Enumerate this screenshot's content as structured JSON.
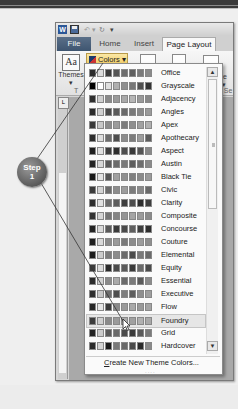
{
  "callout": {
    "line1": "Step",
    "line2": "1"
  },
  "quick_access": {
    "app_icon": "W",
    "save_icon": "save-icon",
    "undo_icon": "undo-icon",
    "redo_icon": "redo-icon",
    "customize_icon": "dropdown-icon"
  },
  "tabs": [
    {
      "label": "File",
      "active": false
    },
    {
      "label": "Home",
      "active": false
    },
    {
      "label": "Insert",
      "active": false
    },
    {
      "label": "Page Layout",
      "active": true
    }
  ],
  "ribbon": {
    "themes_label": "Themes",
    "themes_arrow": "▾",
    "themes_icon_text": "Aa",
    "colors_label": "Colors ▾",
    "size_fragment": "ize",
    "size_arrow": "▾",
    "group_theme_fragment": "T",
    "group_page_setup_fragment": "ge Se"
  },
  "ruler_box": "L",
  "theme_colors": {
    "items": [
      {
        "name": "Office",
        "swatches": [
          "#2b2b2b",
          "#dcdcdc",
          "#3b3b3b",
          "#555555",
          "#6e6e6e",
          "#5f5f5f",
          "#7a7a7a",
          "#8a8a8a"
        ]
      },
      {
        "name": "Grayscale",
        "swatches": [
          "#000000",
          "#ffffff",
          "#e0e0e0",
          "#b0b0b0",
          "#909090",
          "#777777",
          "#505050",
          "#333333"
        ]
      },
      {
        "name": "Adjacency",
        "swatches": [
          "#2f2f2f",
          "#cfcfcf",
          "#8a8a8a",
          "#9a9a9a",
          "#a8a8a8",
          "#b5b5b5",
          "#999999",
          "#888888"
        ]
      },
      {
        "name": "Angles",
        "swatches": [
          "#2a2a2a",
          "#d0d0d0",
          "#4a4a4a",
          "#5a5a5a",
          "#6a6a6a",
          "#7a7a7a",
          "#8a8a8a",
          "#9a9a9a"
        ]
      },
      {
        "name": "Apex",
        "swatches": [
          "#3a3a3a",
          "#c8c8c8",
          "#8c8c8c",
          "#9c9c9c",
          "#7c7c7c",
          "#8f8f8f",
          "#a0a0a0",
          "#b0b0b0"
        ]
      },
      {
        "name": "Apothecary",
        "swatches": [
          "#2c2c2c",
          "#dedede",
          "#6c6c6c",
          "#4c4c4c",
          "#8c8c8c",
          "#7c7c7c",
          "#9c9c9c",
          "#5c5c5c"
        ]
      },
      {
        "name": "Aspect",
        "swatches": [
          "#1e1e1e",
          "#e0e0e0",
          "#3e3e3e",
          "#2e2e2e",
          "#4e4e4e",
          "#3a3a3a",
          "#555555",
          "#888888"
        ]
      },
      {
        "name": "Austin",
        "swatches": [
          "#252525",
          "#d8d8d8",
          "#5a5a5a",
          "#6a6a6a",
          "#7a7a7a",
          "#5e5e5e",
          "#6e6e6e",
          "#8a8a8a"
        ]
      },
      {
        "name": "Black Tie",
        "swatches": [
          "#1a1a1a",
          "#e4e4e4",
          "#555555",
          "#a0a0a0",
          "#909090",
          "#808080",
          "#8a8a8a",
          "#9a9a9a"
        ]
      },
      {
        "name": "Civic",
        "swatches": [
          "#3c3c3c",
          "#d4d4d4",
          "#6c6c6c",
          "#8c8c8c",
          "#9c9c9c",
          "#7c7c7c",
          "#8a8a8a",
          "#6a6a6a"
        ]
      },
      {
        "name": "Clarity",
        "swatches": [
          "#2d2d2d",
          "#e2e2e2",
          "#6d6d6d",
          "#5d5d5d",
          "#3d3d3d",
          "#4d4d4d",
          "#2d2d2d",
          "#3d3d3d"
        ]
      },
      {
        "name": "Composite",
        "swatches": [
          "#333333",
          "#d6d6d6",
          "#757575",
          "#858585",
          "#959595",
          "#a5a5a5",
          "#9a9a9a",
          "#8a8a8a"
        ]
      },
      {
        "name": "Concourse",
        "swatches": [
          "#242424",
          "#dadada",
          "#5a5a5a",
          "#3a3a3a",
          "#4a4a4a",
          "#5e5e5e",
          "#3e3e3e",
          "#2e2e2e"
        ]
      },
      {
        "name": "Couture",
        "swatches": [
          "#1f1f1f",
          "#d9d9d9",
          "#8a8a8a",
          "#9a9a9a",
          "#7a7a7a",
          "#8c8c8c",
          "#9c9c9c",
          "#8e8e8e"
        ]
      },
      {
        "name": "Elemental",
        "swatches": [
          "#1c1c1c",
          "#cccccc",
          "#7c7c7c",
          "#8c8c8c",
          "#6c6c6c",
          "#4c4c4c",
          "#7a7a7a",
          "#6a6a6a"
        ]
      },
      {
        "name": "Equity",
        "swatches": [
          "#3a3a3a",
          "#dcdcdc",
          "#2a2a2a",
          "#4a4a4a",
          "#5a5a5a",
          "#3a3a3a",
          "#6a6a6a",
          "#4a4a4a"
        ]
      },
      {
        "name": "Essential",
        "swatches": [
          "#2a2a2a",
          "#d2d2d2",
          "#8a8a8a",
          "#aaaaaa",
          "#6a6a6a",
          "#7a7a7a",
          "#5a5a5a",
          "#8a8a8a"
        ]
      },
      {
        "name": "Executive",
        "swatches": [
          "#2e2e2e",
          "#c8c8c8",
          "#6e6e6e",
          "#4e4e4e",
          "#7e7e7e",
          "#5e5e5e",
          "#8e8e8e",
          "#9e9e9e"
        ]
      },
      {
        "name": "Flow",
        "swatches": [
          "#262626",
          "#e6e6e6",
          "#3a3a3a",
          "#8a8a8a",
          "#9a9a9a",
          "#aaaaaa",
          "#9a9a9a",
          "#a5a5a5"
        ]
      },
      {
        "name": "Foundry",
        "swatches": [
          "#3c3c3c",
          "#cfcfcf",
          "#8a8a8a",
          "#9a9a9a",
          "#aaaaaa",
          "#a0a0a0",
          "#b0b0b0",
          "#a8a8a8"
        ]
      },
      {
        "name": "Grid",
        "swatches": [
          "#222222",
          "#cccccc",
          "#5a5a5a",
          "#6a6a6a",
          "#4a4a4a",
          "#3a3a3a",
          "#5a5a5a",
          "#7a7a7a"
        ]
      },
      {
        "name": "Hardcover",
        "swatches": [
          "#2a2a2a",
          "#d4d4d4",
          "#1a1a1a",
          "#7a7a7a",
          "#6a6a6a",
          "#4a4a4a",
          "#2a2a2a",
          "#8a8a8a"
        ]
      }
    ],
    "hovered": "Foundry",
    "create_new_prefix": "C",
    "create_new_rest": "reate New Theme Colors...",
    "scroll_up": "▲",
    "scroll_down": "▼",
    "resize_grip": "····"
  }
}
